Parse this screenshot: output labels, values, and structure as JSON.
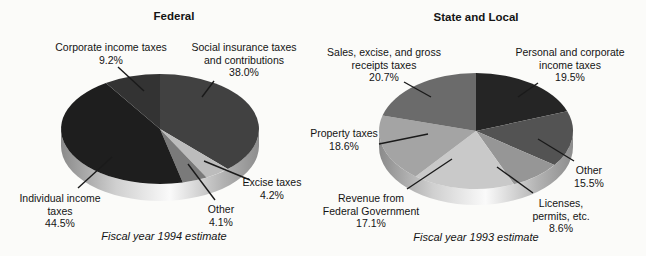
{
  "background": "#fbfbf9",
  "text_color": "#141414",
  "leader_line_color": "#1a1a1a",
  "rim_gradient": [
    "#8a8a8a",
    "#d0d0d0",
    "#fafafa",
    "#b2b2b2",
    "#8d8d8d"
  ],
  "chart_data": [
    {
      "type": "pie",
      "title": "Federal",
      "caption": "Fiscal year 1994 estimate",
      "start_angle_deg": 0,
      "direction": "clockwise",
      "style": "3d-pie",
      "slices": [
        {
          "label": "Social insurance taxes and contributions",
          "label_lines": [
            "Social insurance taxes",
            "and contributions"
          ],
          "pct": "38.0%",
          "value": 38.0,
          "color": "#414141"
        },
        {
          "label": "Excise taxes",
          "label_lines": [
            "Excise taxes"
          ],
          "pct": "4.2%",
          "value": 4.2,
          "color": "#bcbcbc"
        },
        {
          "label": "Other",
          "label_lines": [
            "Other"
          ],
          "pct": "4.1%",
          "value": 4.1,
          "color": "#7a7a7a"
        },
        {
          "label": "Individual income taxes",
          "label_lines": [
            "Individual income",
            "taxes"
          ],
          "pct": "44.5%",
          "value": 44.5,
          "color": "#1e1e1e"
        },
        {
          "label": "Corporate income taxes",
          "label_lines": [
            "Corporate income taxes"
          ],
          "pct": "9.2%",
          "value": 9.2,
          "color": "#333333"
        }
      ]
    },
    {
      "type": "pie",
      "title": "State and Local",
      "caption": "Fiscal year 1993 estimate",
      "start_angle_deg": 0,
      "direction": "clockwise",
      "style": "3d-pie",
      "slices": [
        {
          "label": "Personal and corporate income taxes",
          "label_lines": [
            "Personal and corporate",
            "income taxes"
          ],
          "pct": "19.5%",
          "value": 19.5,
          "color": "#252525"
        },
        {
          "label": "Other",
          "label_lines": [
            "Other"
          ],
          "pct": "15.5%",
          "value": 15.5,
          "color": "#535353"
        },
        {
          "label": "Licenses, permits, etc.",
          "label_lines": [
            "Licenses,",
            "permits, etc."
          ],
          "pct": "8.6%",
          "value": 8.6,
          "color": "#969696"
        },
        {
          "label": "Revenue from Federal Government",
          "label_lines": [
            "Revenue from",
            "Federal Government"
          ],
          "pct": "17.1%",
          "value": 17.1,
          "color": "#c9c9c9"
        },
        {
          "label": "Property taxes",
          "label_lines": [
            "Property taxes"
          ],
          "pct": "18.6%",
          "value": 18.6,
          "color": "#a4a4a4"
        },
        {
          "label": "Sales, excise, and gross receipts taxes",
          "label_lines": [
            "Sales, excise, and gross",
            "receipts taxes"
          ],
          "pct": "20.7%",
          "value": 20.7,
          "color": "#6b6b6b"
        }
      ]
    }
  ]
}
